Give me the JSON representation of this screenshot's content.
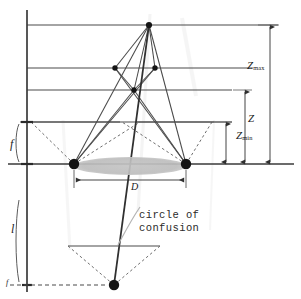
{
  "figure": {
    "background_color": "#ffffff",
    "line_color": "#3a3a3a",
    "dash_color": "#6e6e6e",
    "lens_fill_color": "#b9b9b9",
    "node_color": "#141414"
  },
  "labels": {
    "z_max": "Z",
    "z_max_sub": "max",
    "z": "Z",
    "z_min": "Z",
    "z_min_sub": "min",
    "aperture_d": "D",
    "focal_f": "f",
    "image_distance_l": "l",
    "focal_f_prime": "f",
    "circle_of_confusion_line1": "circle of",
    "circle_of_confusion_line2": "confusion"
  },
  "geometry": {
    "optical_axis_y": 164,
    "vertical_axis_x": 27,
    "lens_center_x": 130,
    "lens_left_x": 74,
    "lens_right_x": 186,
    "lens_half_height": 9,
    "object_far_y": 25,
    "object_mid_y": 68,
    "object_near_y": 90,
    "front_plane_y": 122,
    "image_plane_y": 246,
    "image_point_y": 285,
    "apex_top": {
      "x": 149,
      "y": 25
    },
    "node_left": {
      "x": 115,
      "y": 68
    },
    "node_right": {
      "x": 155,
      "y": 68
    },
    "node_center": {
      "x": 134,
      "y": 90
    },
    "image_node": {
      "x": 114,
      "y": 285
    }
  },
  "dimensions": [
    {
      "name": "Z_min",
      "from_y": 122,
      "to_y": 164,
      "x": 226
    },
    {
      "name": "Z",
      "from_y": 90,
      "to_y": 164,
      "x": 245
    },
    {
      "name": "Z_max",
      "from_y": 25,
      "to_y": 164,
      "x": 270
    }
  ],
  "horizontal_rules_y": [
    25,
    68,
    90,
    122,
    164
  ],
  "markers": {
    "lens_edge_left": true,
    "lens_edge_right": true,
    "top_apex": true,
    "image_point": true
  }
}
